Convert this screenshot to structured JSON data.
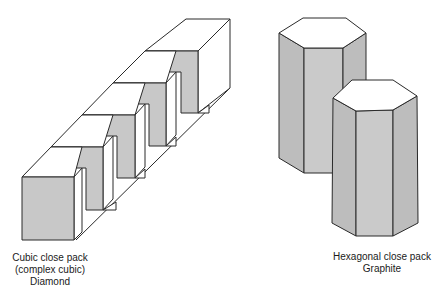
{
  "figures": [
    {
      "id": "cubic",
      "caption": [
        "Cubic close pack",
        "(complex cubic)",
        "Diamond"
      ]
    },
    {
      "id": "hexagonal",
      "caption": [
        "Hexagonal close pack",
        "Graphite"
      ]
    }
  ],
  "colors": {
    "face_gray": "#c8c8c8",
    "face_dark": "#bdbdbd",
    "face_white": "#ffffff",
    "stroke": "#2a2a2a"
  }
}
